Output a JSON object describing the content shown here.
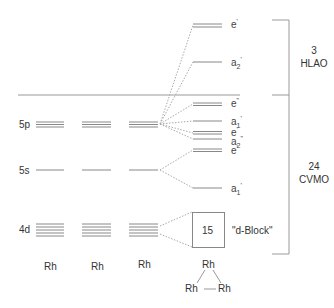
{
  "diagram": {
    "atomic_orbitals": [
      {
        "label": "5p",
        "degeneracy": 3
      },
      {
        "label": "5s",
        "degeneracy": 1
      },
      {
        "label": "4d",
        "degeneracy": 5
      }
    ],
    "atoms": [
      "Rh",
      "Rh",
      "Rh"
    ],
    "molecular_orbitals": [
      {
        "symmetry": "e'",
        "base": "e",
        "sub": "",
        "sup": "'",
        "degeneracy": 2,
        "group": "HLAO"
      },
      {
        "symmetry": "a2'",
        "base": "a",
        "sub": "2",
        "sup": "'",
        "degeneracy": 1,
        "group": "HLAO"
      },
      {
        "symmetry": "e''",
        "base": "e",
        "sub": "",
        "sup": "\"",
        "degeneracy": 2,
        "group": "CVMO"
      },
      {
        "symmetry": "a1'",
        "base": "a",
        "sub": "1",
        "sup": "'",
        "degeneracy": 1,
        "group": "CVMO"
      },
      {
        "symmetry": "e'",
        "base": "e",
        "sub": "",
        "sup": "'",
        "degeneracy": 2,
        "group": "CVMO"
      },
      {
        "symmetry": "a2''",
        "base": "a",
        "sub": "2",
        "sup": "\"",
        "degeneracy": 1,
        "group": "CVMO"
      },
      {
        "symmetry": "e'",
        "base": "e",
        "sub": "",
        "sup": "'",
        "degeneracy": 2,
        "group": "CVMO"
      },
      {
        "symmetry": "a1'",
        "base": "a",
        "sub": "1",
        "sup": "'",
        "degeneracy": 1,
        "group": "CVMO"
      }
    ],
    "d_block": {
      "count": "15",
      "label": "\"d-Block\""
    },
    "brackets": [
      {
        "count": "3",
        "label": "HLAO"
      },
      {
        "count": "24",
        "label": "CVMO"
      }
    ],
    "cluster": {
      "top": "Rh",
      "bottom_left": "Rh",
      "bottom_right": "Rh"
    }
  }
}
